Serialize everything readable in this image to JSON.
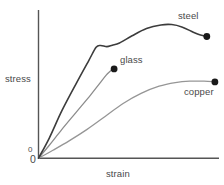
{
  "chart_data": {
    "type": "line",
    "title": "",
    "xlabel": "strain",
    "ylabel": "stress",
    "grid": false,
    "legend_position": "inline-end-of-curve",
    "axis_origin_label": "0",
    "axis_origin_label_secondary": "0",
    "xlim": [
      0,
      1
    ],
    "ylim": [
      0,
      1
    ],
    "xticks": [],
    "yticks": [],
    "note": "Qualitative stress-strain curves; axes unlabeled except origin.",
    "series": [
      {
        "name": "steel",
        "color": "#3c3c3c",
        "width": 1.6,
        "endpoint_marker": "dot",
        "points": [
          [
            0.0,
            0.0
          ],
          [
            0.06,
            0.14
          ],
          [
            0.13,
            0.33
          ],
          [
            0.21,
            0.52
          ],
          [
            0.28,
            0.68
          ],
          [
            0.32,
            0.77
          ],
          [
            0.345,
            0.783
          ],
          [
            0.38,
            0.775
          ],
          [
            0.41,
            0.785
          ],
          [
            0.45,
            0.8
          ],
          [
            0.52,
            0.85
          ],
          [
            0.6,
            0.9
          ],
          [
            0.68,
            0.925
          ],
          [
            0.74,
            0.928
          ],
          [
            0.8,
            0.91
          ],
          [
            0.86,
            0.875
          ],
          [
            0.9,
            0.855
          ],
          [
            0.935,
            0.845
          ]
        ]
      },
      {
        "name": "glass",
        "color": "#8c8c8c",
        "width": 1.3,
        "endpoint_marker": "dot",
        "points": [
          [
            0.0,
            0.0
          ],
          [
            0.06,
            0.09
          ],
          [
            0.13,
            0.2
          ],
          [
            0.21,
            0.32
          ],
          [
            0.29,
            0.44
          ],
          [
            0.34,
            0.52
          ],
          [
            0.375,
            0.575
          ],
          [
            0.395,
            0.6
          ],
          [
            0.41,
            0.615
          ],
          [
            0.42,
            0.62
          ]
        ]
      },
      {
        "name": "copper",
        "color": "#969696",
        "width": 1.3,
        "endpoint_marker": "dot",
        "points": [
          [
            0.0,
            0.0
          ],
          [
            0.08,
            0.055
          ],
          [
            0.17,
            0.12
          ],
          [
            0.27,
            0.2
          ],
          [
            0.37,
            0.29
          ],
          [
            0.47,
            0.38
          ],
          [
            0.57,
            0.45
          ],
          [
            0.67,
            0.5
          ],
          [
            0.76,
            0.525
          ],
          [
            0.84,
            0.535
          ],
          [
            0.92,
            0.535
          ],
          [
            0.98,
            0.53
          ]
        ]
      }
    ]
  },
  "axes": {
    "y_axis_label": "stress",
    "x_axis_label": "strain",
    "origin_upper": "0",
    "origin_lower": "0",
    "axis_color": "#555555"
  },
  "labels": {
    "steel": "steel",
    "glass": "glass",
    "copper": "copper"
  },
  "colors": {
    "background": "#ffffff",
    "text": "#4a4a4a",
    "axis": "#555555",
    "steel": "#3c3c3c",
    "glass": "#8c8c8c",
    "copper": "#969696",
    "marker": "#1a1a1a"
  }
}
